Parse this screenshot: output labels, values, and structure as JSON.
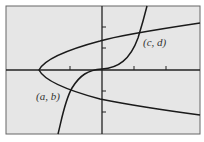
{
  "figure": {
    "background": "#e6e6e6",
    "frame_color": "#666666",
    "curve_color": "#1a1a1a",
    "labels": {
      "point_ab": "(a, b)",
      "point_cd": "(c, d)"
    },
    "curves": [
      {
        "name": "sideways-parabola",
        "description": "parabola opening to the right, vertex on negative x-axis"
      },
      {
        "name": "cubic-curve",
        "description": "increasing cubic-like curve through the origin"
      }
    ],
    "intersections": [
      {
        "label": "(a, b)",
        "quadrant": "III"
      },
      {
        "label": "(c, d)",
        "quadrant": "I"
      }
    ],
    "x_ticks": 3,
    "y_ticks": 4
  }
}
